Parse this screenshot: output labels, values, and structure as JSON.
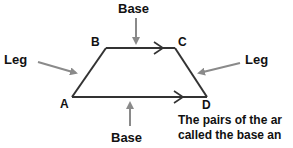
{
  "diagram": {
    "vertices": {
      "A": "A",
      "B": "B",
      "C": "C",
      "D": "D"
    },
    "labels": {
      "top_base": "Base",
      "bottom_base": "Base",
      "left_leg": "Leg",
      "right_leg": "Leg"
    },
    "caption": {
      "line1": "The pairs of the ar",
      "line2": "called the base an"
    },
    "colors": {
      "shape_stroke": "#333333",
      "pointer_arrow": "#8a8a8a",
      "text": "#111111"
    }
  }
}
